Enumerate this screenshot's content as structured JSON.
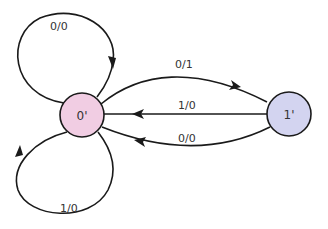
{
  "diagram": {
    "type": "state-machine",
    "nodes": [
      {
        "id": "s0",
        "label": "0'",
        "fill": "#f1cde3",
        "cx": 82,
        "cy": 115,
        "r": 22
      },
      {
        "id": "s1",
        "label": "1'",
        "fill": "#d3d4f0",
        "cx": 289,
        "cy": 114,
        "r": 22
      }
    ],
    "edges": [
      {
        "from": "0'",
        "to": "0'",
        "label": "0/0",
        "position": "top-self-loop"
      },
      {
        "from": "0'",
        "to": "0'",
        "label": "1/0",
        "position": "bottom-self-loop"
      },
      {
        "from": "0'",
        "to": "1'",
        "label": "0/1"
      },
      {
        "from": "1'",
        "to": "0'",
        "label": "1/0"
      },
      {
        "from": "1'",
        "to": "0'",
        "label": "0/0"
      }
    ],
    "colors": {
      "stroke": "#1a1a1a",
      "text": "#333333"
    }
  }
}
